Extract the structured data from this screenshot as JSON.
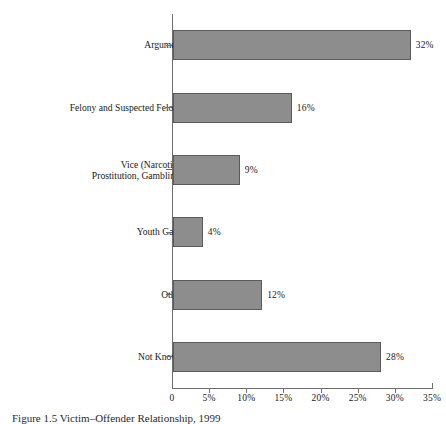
{
  "chart_data": {
    "type": "bar",
    "orientation": "horizontal",
    "title": "",
    "xlabel": "",
    "ylabel": "",
    "categories": [
      "Argument",
      "Felony and Suspected Felony",
      "Vice (Narcotics,\nProstitution, Gambling)",
      "Youth Gang",
      "Other",
      "Not Known"
    ],
    "values": [
      32,
      16,
      9,
      4,
      12,
      28
    ],
    "value_labels": [
      "32%",
      "16%",
      "9%",
      "4%",
      "12%",
      "28%"
    ],
    "xlim": [
      0,
      35
    ],
    "xticks": [
      0,
      5,
      10,
      15,
      20,
      25,
      30,
      35
    ],
    "xtick_labels": [
      "0",
      "5%",
      "10%",
      "15%",
      "20%",
      "25%",
      "30%",
      "35%"
    ],
    "grid": false,
    "legend": null,
    "bar_color": "#8d8d8d",
    "bar_edge_color": "#5a5a5a",
    "axis_color": "#6e6e6e"
  },
  "caption": {
    "text": "Figure 1.5  Victim–Offender Relationship, 1999"
  }
}
